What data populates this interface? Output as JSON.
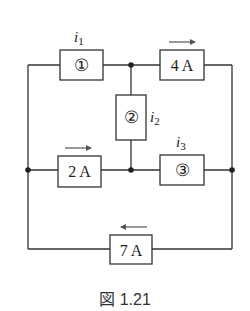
{
  "figure": {
    "caption": "図 1.21",
    "elements": {
      "box1": {
        "label": "①",
        "current_label": "i",
        "current_sub": "1"
      },
      "box2": {
        "label": "②",
        "current_label": "i",
        "current_sub": "2"
      },
      "box3": {
        "label": "③",
        "current_label": "i",
        "current_sub": "3"
      },
      "source_4a": {
        "label": "4 A",
        "arrow_direction": "right"
      },
      "source_2a": {
        "label": "2 A",
        "arrow_direction": "right"
      },
      "source_7a": {
        "label": "7 A",
        "arrow_direction": "left"
      }
    },
    "colors": {
      "line": "#333333",
      "background": "#ffffff"
    }
  }
}
